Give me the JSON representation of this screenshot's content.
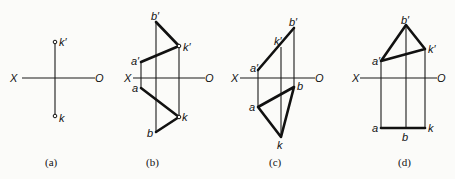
{
  "figure": {
    "panels": [
      {
        "id": "a",
        "caption": "(a)",
        "axis": {
          "left": "X",
          "right": "O"
        },
        "points": {
          "k_prime": "k′",
          "k": "k"
        }
      },
      {
        "id": "b",
        "caption": "(b)",
        "axis": {
          "left": "X",
          "right": "O"
        },
        "points": {
          "b_prime": "b′",
          "k_prime": "k′",
          "a_prime": "a′",
          "a": "a",
          "k": "k",
          "b": "b"
        }
      },
      {
        "id": "c",
        "caption": "(c)",
        "axis": {
          "left": "X",
          "right": "O"
        },
        "points": {
          "b_prime": "b′",
          "k_prime": "k′",
          "a_prime": "a′",
          "a": "a",
          "b": "b",
          "k": "k"
        }
      },
      {
        "id": "d",
        "caption": "(d)",
        "axis": {
          "left": "X",
          "right": "O"
        },
        "points": {
          "b_prime": "b′",
          "k_prime": "k′",
          "a_prime": "a′",
          "a": "a",
          "b": "b",
          "k": "k"
        }
      }
    ]
  }
}
